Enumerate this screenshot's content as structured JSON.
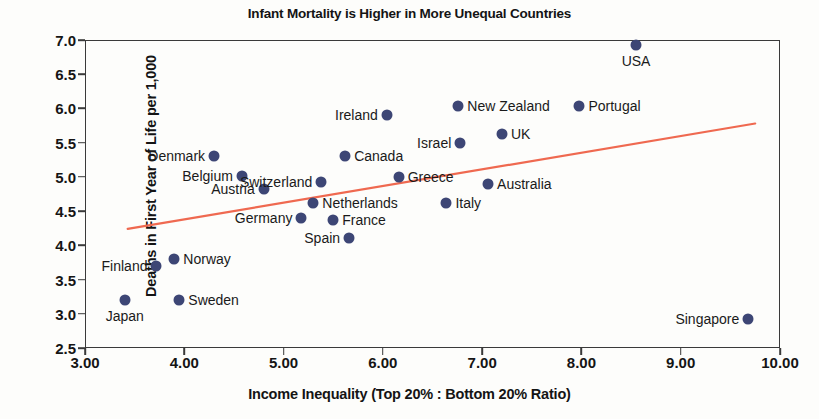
{
  "chart_data": {
    "type": "scatter",
    "title": "Infant Mortality is Higher in More Unequal Countries",
    "xlabel": "Income Inequality (Top 20% : Bottom 20% Ratio)",
    "ylabel": "Deaths in First Year of Life per 1,000",
    "xlim": [
      3.0,
      10.0
    ],
    "ylim": [
      2.5,
      7.0
    ],
    "grid": false,
    "legend": "none",
    "marker_color": "#3d4675",
    "trendline_color": "#ef6950",
    "xticks": [
      "3.00",
      "4.00",
      "5.00",
      "6.00",
      "7.00",
      "8.00",
      "9.00",
      "10.00"
    ],
    "xtick_values": [
      3,
      4,
      5,
      6,
      7,
      8,
      9,
      10
    ],
    "yticks": [
      "2.5",
      "3.0",
      "3.5",
      "4.0",
      "4.5",
      "5.0",
      "5.5",
      "6.0",
      "6.5",
      "7.0"
    ],
    "ytick_values": [
      2.5,
      3.0,
      3.5,
      4.0,
      4.5,
      5.0,
      5.5,
      6.0,
      6.5,
      7.0
    ],
    "trendline": {
      "x0": 3.43,
      "y0": 4.24,
      "x1": 9.75,
      "y1": 5.78
    },
    "points": [
      {
        "label": "Japan",
        "x": 3.4,
        "y": 3.2,
        "label_pos": "below"
      },
      {
        "label": "Finland",
        "x": 3.72,
        "y": 3.7,
        "label_pos": "left"
      },
      {
        "label": "Norway",
        "x": 3.9,
        "y": 3.8,
        "label_pos": "right"
      },
      {
        "label": "Sweden",
        "x": 3.95,
        "y": 3.2,
        "label_pos": "right"
      },
      {
        "label": "Denmark",
        "x": 4.3,
        "y": 5.3,
        "label_pos": "left"
      },
      {
        "label": "Belgium",
        "x": 4.58,
        "y": 5.02,
        "label_pos": "left"
      },
      {
        "label": "Austria",
        "x": 4.8,
        "y": 4.82,
        "label_pos": "left"
      },
      {
        "label": "Germany",
        "x": 5.18,
        "y": 4.4,
        "label_pos": "left"
      },
      {
        "label": "Netherlands",
        "x": 5.3,
        "y": 4.62,
        "label_pos": "right"
      },
      {
        "label": "Switzerland",
        "x": 5.38,
        "y": 4.92,
        "label_pos": "left"
      },
      {
        "label": "France",
        "x": 5.5,
        "y": 4.37,
        "label_pos": "right"
      },
      {
        "label": "Canada",
        "x": 5.62,
        "y": 5.3,
        "label_pos": "right"
      },
      {
        "label": "Spain",
        "x": 5.66,
        "y": 4.1,
        "label_pos": "left"
      },
      {
        "label": "Ireland",
        "x": 6.04,
        "y": 5.9,
        "label_pos": "left"
      },
      {
        "label": "Greece",
        "x": 6.16,
        "y": 5.0,
        "label_pos": "right"
      },
      {
        "label": "Italy",
        "x": 6.64,
        "y": 4.62,
        "label_pos": "right"
      },
      {
        "label": "New Zealand",
        "x": 6.76,
        "y": 6.03,
        "label_pos": "right"
      },
      {
        "label": "Israel",
        "x": 6.78,
        "y": 5.5,
        "label_pos": "left"
      },
      {
        "label": "Australia",
        "x": 7.06,
        "y": 4.9,
        "label_pos": "right"
      },
      {
        "label": "UK",
        "x": 7.2,
        "y": 5.62,
        "label_pos": "right"
      },
      {
        "label": "Portugal",
        "x": 7.98,
        "y": 6.03,
        "label_pos": "right"
      },
      {
        "label": "USA",
        "x": 8.55,
        "y": 6.92,
        "label_pos": "below"
      },
      {
        "label": "Singapore",
        "x": 9.68,
        "y": 2.93,
        "label_pos": "left"
      }
    ]
  }
}
